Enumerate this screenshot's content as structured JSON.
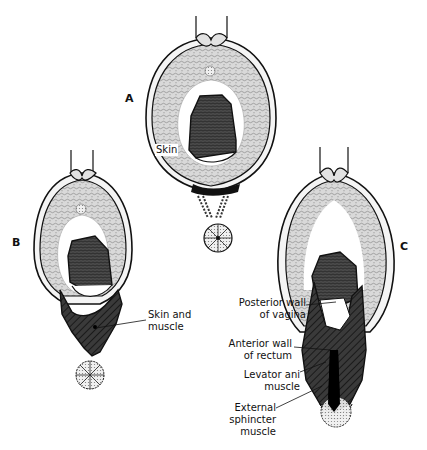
{
  "figure": {
    "panels": [
      {
        "id": "A",
        "letter": "A",
        "labels": [
          {
            "text": "Skin"
          }
        ]
      },
      {
        "id": "B",
        "letter": "B",
        "labels": [
          {
            "line1": "Skin and",
            "line2": "muscle"
          }
        ]
      },
      {
        "id": "C",
        "letter": "C",
        "labels": [
          {
            "line1": "Posterior wall",
            "line2": "of vagina"
          },
          {
            "line1": "Anterior wall",
            "line2": "of rectum"
          },
          {
            "line1": "Levator ani",
            "line2": "muscle"
          },
          {
            "line1": "External",
            "line2": "sphincter",
            "line3": "muscle"
          }
        ]
      }
    ],
    "colors": {
      "outline": "#111111",
      "stipple": "#cfcfcf",
      "dark_fill": "#3a3a3a",
      "labia": "#e2e2e2",
      "background": "#ffffff"
    }
  }
}
